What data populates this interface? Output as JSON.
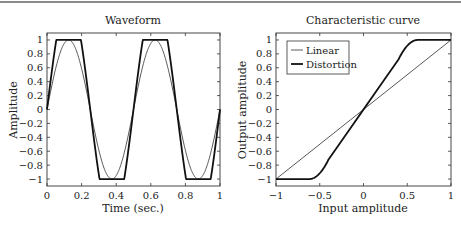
{
  "chart_data": [
    {
      "type": "line",
      "title": "Waveform",
      "xlabel": "Time (sec.)",
      "ylabel": "Amplitude",
      "xlim": [
        0,
        1
      ],
      "ylim": [
        -1.1,
        1.1
      ],
      "xticks": [
        "0",
        "0.2",
        "0.4",
        "0.6",
        "0.8",
        "1"
      ],
      "yticks": [
        "1",
        "0.8",
        "0.6",
        "0.4",
        "0.2",
        "0",
        "-0.2",
        "-0.4",
        "-0.6",
        "-0.8",
        "-1"
      ],
      "grid": false,
      "series": [
        {
          "name": "Sine (2 Hz)",
          "style": "thin",
          "function": "sin(2*pi*2*t)"
        },
        {
          "name": "Distorted (clipped)",
          "style": "thick",
          "function": "clip(sin(2*pi*2*t)*1.6,-1,1)"
        }
      ]
    },
    {
      "type": "line",
      "title": "Characteristic curve",
      "xlabel": "Input amplitude",
      "ylabel": "Output amplitude",
      "xlim": [
        -1,
        1
      ],
      "ylim": [
        -1.1,
        1.1
      ],
      "xticks": [
        "-1",
        "-0.5",
        "0",
        "0.5",
        "1"
      ],
      "yticks": [
        "1",
        "0.8",
        "0.6",
        "0.4",
        "0.2",
        "0",
        "-0.2",
        "-0.4",
        "-0.6",
        "-0.8",
        "-1"
      ],
      "grid": false,
      "legend": {
        "position": "upper left",
        "entries": [
          "Linear",
          "Distortion"
        ]
      },
      "series": [
        {
          "name": "Linear",
          "style": "thin",
          "x": [
            -1,
            1
          ],
          "y": [
            -1,
            1
          ]
        },
        {
          "name": "Distortion",
          "style": "thick",
          "x": [
            -1,
            -0.6,
            -0.4,
            0,
            0.4,
            0.6,
            1
          ],
          "y": [
            -1,
            -1,
            -0.75,
            0,
            0.75,
            1,
            1
          ]
        }
      ]
    }
  ],
  "labels": {
    "left_title": "Waveform",
    "left_xlabel": "Time (sec.)",
    "left_ylabel": "Amplitude",
    "right_title": "Characteristic curve",
    "right_xlabel": "Input amplitude",
    "right_ylabel": "Output amplitude",
    "legend_linear": "Linear",
    "legend_distortion": "Distortion"
  }
}
